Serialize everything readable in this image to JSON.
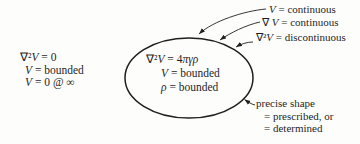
{
  "colors": {
    "paper": "#fdfdfc",
    "ink": "#1f1f1f"
  },
  "outside_region": {
    "lines": [
      {
        "head": "∇²",
        "v": "V",
        "tail": " = 0"
      },
      {
        "head": "",
        "v": "V",
        "tail": " = bounded"
      },
      {
        "head": "",
        "v": "V",
        "tail": " = 0 @ ∞"
      }
    ]
  },
  "ellipse_region": {
    "lines": [
      {
        "head": "∇²",
        "v": "V",
        "tail": " = 4",
        "tail_greek": "πγρ"
      },
      {
        "head": "",
        "v": "V",
        "tail": " = bounded",
        "tail_greek": ""
      },
      {
        "head": "",
        "v": "ρ",
        "tail": " = bounded",
        "tail_greek": ""
      }
    ]
  },
  "boundary_labels": [
    {
      "head": "",
      "v": "V",
      "tail": " = continuous"
    },
    {
      "head": "∇ ",
      "v": "V",
      "tail": " = continuous"
    },
    {
      "head": "∇²",
      "v": "V",
      "tail": " = discontinuous"
    }
  ],
  "shape_note": {
    "lines": [
      "precise shape",
      "= prescribed, or",
      "= determined"
    ]
  }
}
